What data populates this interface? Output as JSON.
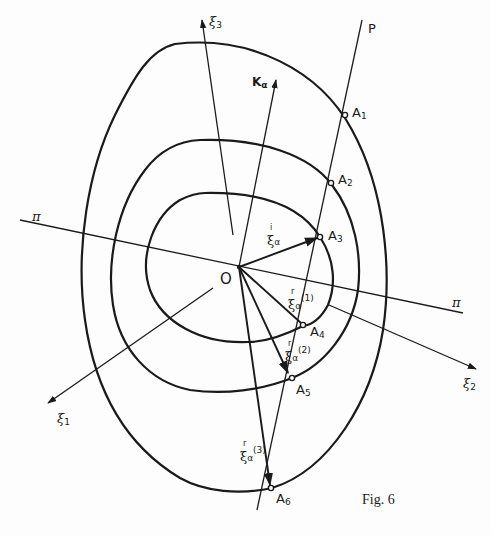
{
  "figure": {
    "caption": "Fig. 6",
    "origin_label": "O",
    "line_label_P": "P",
    "plane_label": "π",
    "vector_K": {
      "main": "K",
      "sub": "α"
    },
    "axes": [
      {
        "id": "xi3",
        "main": "ξ",
        "sub": "3"
      },
      {
        "id": "xi2",
        "main": "ξ",
        "sub": "2"
      },
      {
        "id": "xi1",
        "main": "ξ",
        "sub": "1"
      }
    ],
    "points": [
      {
        "main": "A",
        "sub": "1"
      },
      {
        "main": "A",
        "sub": "2"
      },
      {
        "main": "A",
        "sub": "3"
      },
      {
        "main": "A",
        "sub": "4"
      },
      {
        "main": "A",
        "sub": "5"
      },
      {
        "main": "A",
        "sub": "6"
      }
    ],
    "vectors": [
      {
        "accent": "i",
        "main": "ξ",
        "sub": "α",
        "sup": ""
      },
      {
        "accent": "r",
        "main": "ξ",
        "sub": "α",
        "sup": "(1)"
      },
      {
        "accent": "r",
        "main": "ξ",
        "sub": "α",
        "sup": "(2)"
      },
      {
        "accent": "r",
        "main": "ξ",
        "sub": "α",
        "sup": "(3)"
      }
    ],
    "colors": {
      "ink": "#1a1a1a",
      "paper": "#fdfdfd"
    }
  }
}
